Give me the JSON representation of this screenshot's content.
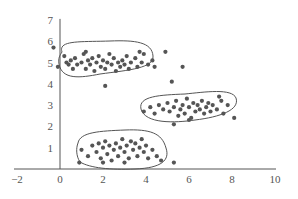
{
  "chart_data": {
    "type": "scatter",
    "title": "",
    "xlabel": "",
    "ylabel": "",
    "xlim": [
      -2,
      10
    ],
    "ylim": [
      0,
      7
    ],
    "x_ticks": [
      "-2",
      "0",
      "2",
      "4",
      "6",
      "8",
      "10"
    ],
    "y_ticks": [
      "1",
      "2",
      "3",
      "4",
      "5",
      "6",
      "7"
    ],
    "grid": false,
    "legend": "none",
    "colors": {
      "points": "#555555",
      "axes": "#555555",
      "outline": "#555555",
      "background": "#ffffff"
    },
    "clusters": [
      {
        "name": "cluster-top-left",
        "center": [
          2.0,
          5.0
        ],
        "outline": "rounded-loop",
        "points": [
          [
            -0.3,
            5.7
          ],
          [
            -0.1,
            4.8
          ],
          [
            0.2,
            5.3
          ],
          [
            0.3,
            5.0
          ],
          [
            0.4,
            4.9
          ],
          [
            0.5,
            5.1
          ],
          [
            0.6,
            4.7
          ],
          [
            0.7,
            5.2
          ],
          [
            0.8,
            4.9
          ],
          [
            1.0,
            5.0
          ],
          [
            1.1,
            5.4
          ],
          [
            1.2,
            4.7
          ],
          [
            1.3,
            5.1
          ],
          [
            1.4,
            4.9
          ],
          [
            1.5,
            5.2
          ],
          [
            1.6,
            4.6
          ],
          [
            1.7,
            5.0
          ],
          [
            1.8,
            5.3
          ],
          [
            1.9,
            4.8
          ],
          [
            2.0,
            5.1
          ],
          [
            2.1,
            4.7
          ],
          [
            2.2,
            5.0
          ],
          [
            2.3,
            5.4
          ],
          [
            2.4,
            4.9
          ],
          [
            2.5,
            5.2
          ],
          [
            2.6,
            4.6
          ],
          [
            2.7,
            5.0
          ],
          [
            2.8,
            4.8
          ],
          [
            2.9,
            5.1
          ],
          [
            3.0,
            4.9
          ],
          [
            3.1,
            5.3
          ],
          [
            3.2,
            4.7
          ],
          [
            3.3,
            5.0
          ],
          [
            3.5,
            5.2
          ],
          [
            3.6,
            4.8
          ],
          [
            3.8,
            5.0
          ],
          [
            3.9,
            5.4
          ],
          [
            4.1,
            4.9
          ],
          [
            4.3,
            5.1
          ],
          [
            4.4,
            4.8
          ],
          [
            2.1,
            3.9
          ],
          [
            1.2,
            5.5
          ],
          [
            3.7,
            5.5
          ]
        ]
      },
      {
        "name": "cluster-middle-right",
        "center": [
          6.2,
          2.9
        ],
        "outline": "rounded-loop",
        "points": [
          [
            3.9,
            2.7
          ],
          [
            4.2,
            2.9
          ],
          [
            4.4,
            2.6
          ],
          [
            4.6,
            3.0
          ],
          [
            4.8,
            2.8
          ],
          [
            5.0,
            3.1
          ],
          [
            5.1,
            2.7
          ],
          [
            5.3,
            2.9
          ],
          [
            5.4,
            3.2
          ],
          [
            5.5,
            2.5
          ],
          [
            5.6,
            2.8
          ],
          [
            5.7,
            3.0
          ],
          [
            5.8,
            2.6
          ],
          [
            5.9,
            3.3
          ],
          [
            6.0,
            2.9
          ],
          [
            6.1,
            2.4
          ],
          [
            6.2,
            3.1
          ],
          [
            6.3,
            2.7
          ],
          [
            6.4,
            3.0
          ],
          [
            6.5,
            2.8
          ],
          [
            6.6,
            3.2
          ],
          [
            6.7,
            2.6
          ],
          [
            6.8,
            2.9
          ],
          [
            6.9,
            3.1
          ],
          [
            7.0,
            2.7
          ],
          [
            7.1,
            3.0
          ],
          [
            7.3,
            2.8
          ],
          [
            7.5,
            3.2
          ],
          [
            7.6,
            2.6
          ],
          [
            7.8,
            3.0
          ],
          [
            8.1,
            2.4
          ],
          [
            5.3,
            2.1
          ],
          [
            6.0,
            2.3
          ],
          [
            7.4,
            3.4
          ]
        ]
      },
      {
        "name": "cluster-bottom",
        "center": [
          3.0,
          1.0
        ],
        "outline": "rounded-loop",
        "points": [
          [
            0.9,
            0.3
          ],
          [
            1.0,
            0.9
          ],
          [
            1.3,
            0.6
          ],
          [
            1.5,
            1.1
          ],
          [
            1.7,
            0.8
          ],
          [
            1.8,
            1.2
          ],
          [
            1.9,
            0.5
          ],
          [
            2.0,
            1.0
          ],
          [
            2.1,
            1.3
          ],
          [
            2.2,
            0.7
          ],
          [
            2.3,
            1.1
          ],
          [
            2.4,
            0.4
          ],
          [
            2.5,
            0.9
          ],
          [
            2.6,
            1.2
          ],
          [
            2.7,
            0.6
          ],
          [
            2.8,
            1.0
          ],
          [
            2.9,
            1.4
          ],
          [
            3.0,
            0.8
          ],
          [
            3.1,
            1.1
          ],
          [
            3.2,
            0.5
          ],
          [
            3.3,
            1.3
          ],
          [
            3.4,
            0.9
          ],
          [
            3.5,
            1.2
          ],
          [
            3.6,
            0.6
          ],
          [
            3.7,
            1.0
          ],
          [
            3.8,
            1.4
          ],
          [
            3.9,
            0.8
          ],
          [
            4.0,
            1.1
          ],
          [
            4.1,
            0.5
          ],
          [
            4.3,
            0.9
          ],
          [
            4.5,
            0.6
          ],
          [
            4.7,
            0.4
          ],
          [
            5.3,
            0.3
          ],
          [
            2.0,
            0.3
          ],
          [
            3.0,
            0.3
          ]
        ]
      },
      {
        "name": "outliers",
        "points": [
          [
            4.9,
            5.5
          ],
          [
            5.7,
            4.8
          ],
          [
            5.2,
            4.1
          ]
        ]
      }
    ]
  }
}
